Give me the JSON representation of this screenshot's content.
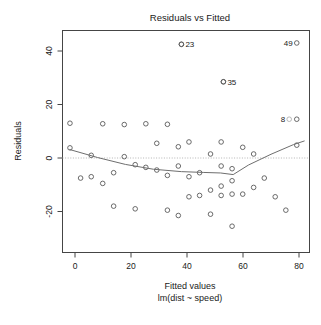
{
  "chart_data": {
    "type": "scatter",
    "title": "Residuals vs Fitted",
    "xlabel": "Fitted values",
    "sublabel": "lm(dist ~ speed)",
    "ylabel": "Residuals",
    "xlim": [
      -7,
      84
    ],
    "ylim": [
      -31,
      48
    ],
    "xticks": [
      0,
      20,
      40,
      60,
      80
    ],
    "xtick_labels": [
      "0",
      "20",
      "40",
      "60",
      "80"
    ],
    "yticks": [
      -20,
      0,
      20,
      40
    ],
    "ytick_labels": [
      "-20",
      "0",
      "20",
      "40"
    ],
    "grid": false,
    "zero_reference_line": 0,
    "legend": null,
    "point_color": "#5a5a5a",
    "smoother_color": "#6e6e6e",
    "zero_line_color": "#b4b4b4",
    "points": [
      {
        "x": -1.8,
        "y": 3.8
      },
      {
        "x": -1.8,
        "y": 13.0
      },
      {
        "x": 2.0,
        "y": -7.5
      },
      {
        "x": 5.8,
        "y": -7.0
      },
      {
        "x": 5.8,
        "y": 1.0
      },
      {
        "x": 9.9,
        "y": 12.8
      },
      {
        "x": 9.9,
        "y": -9.5
      },
      {
        "x": 13.8,
        "y": -5.5
      },
      {
        "x": 13.8,
        "y": -18.0
      },
      {
        "x": 17.6,
        "y": 0.5
      },
      {
        "x": 17.6,
        "y": 12.5
      },
      {
        "x": 21.5,
        "y": -2.5
      },
      {
        "x": 21.5,
        "y": -19.0
      },
      {
        "x": 25.3,
        "y": -3.5
      },
      {
        "x": 25.3,
        "y": 12.8
      },
      {
        "x": 29.2,
        "y": -4.5
      },
      {
        "x": 29.2,
        "y": 5.5
      },
      {
        "x": 33.0,
        "y": -6.5
      },
      {
        "x": 33.0,
        "y": 12.6
      },
      {
        "x": 33.0,
        "y": -19.5
      },
      {
        "x": 36.9,
        "y": -3.0
      },
      {
        "x": 36.9,
        "y": 4.2
      },
      {
        "x": 36.9,
        "y": -21.5
      },
      {
        "x": 38.0,
        "y": 42.5
      },
      {
        "x": 40.7,
        "y": -7.0
      },
      {
        "x": 40.7,
        "y": 6.0
      },
      {
        "x": 40.7,
        "y": -14.5
      },
      {
        "x": 44.5,
        "y": -5.5
      },
      {
        "x": 44.5,
        "y": -14.0
      },
      {
        "x": 48.4,
        "y": 1.5
      },
      {
        "x": 48.4,
        "y": -12.0
      },
      {
        "x": 48.4,
        "y": -21.0
      },
      {
        "x": 52.2,
        "y": 6.0
      },
      {
        "x": 52.2,
        "y": -3.0
      },
      {
        "x": 52.2,
        "y": -10.5
      },
      {
        "x": 52.2,
        "y": -14.0
      },
      {
        "x": 53.0,
        "y": 28.5
      },
      {
        "x": 56.1,
        "y": -4.0
      },
      {
        "x": 56.1,
        "y": -8.5
      },
      {
        "x": 56.1,
        "y": -13.5
      },
      {
        "x": 56.1,
        "y": -25.5
      },
      {
        "x": 59.9,
        "y": 4.0
      },
      {
        "x": 59.9,
        "y": -13.5
      },
      {
        "x": 63.8,
        "y": 1.5
      },
      {
        "x": 63.8,
        "y": -11.0
      },
      {
        "x": 67.6,
        "y": -7.5
      },
      {
        "x": 71.5,
        "y": -14.5
      },
      {
        "x": 75.3,
        "y": -19.5
      },
      {
        "x": 79.2,
        "y": 14.5
      },
      {
        "x": 79.2,
        "y": 4.8
      }
    ],
    "labeled_points": [
      {
        "label": "23",
        "x": 38.0,
        "y": 42.5,
        "label_side": "right"
      },
      {
        "label": "35",
        "x": 53.0,
        "y": 28.5,
        "label_side": "right"
      },
      {
        "label": "49",
        "x": 79.2,
        "y": 43.0,
        "label_side": "left"
      },
      {
        "label": "8",
        "x": 76.5,
        "y": 14.5,
        "label_side": "left"
      }
    ],
    "smoother": [
      {
        "x": -2.0,
        "y": 3.2
      },
      {
        "x": 8.0,
        "y": 0.2
      },
      {
        "x": 18.0,
        "y": -2.4
      },
      {
        "x": 28.0,
        "y": -4.2
      },
      {
        "x": 38.0,
        "y": -5.1
      },
      {
        "x": 46.0,
        "y": -5.4
      },
      {
        "x": 52.0,
        "y": -5.6
      },
      {
        "x": 56.5,
        "y": -6.2
      },
      {
        "x": 62.0,
        "y": -2.6
      },
      {
        "x": 70.0,
        "y": 1.4
      },
      {
        "x": 78.0,
        "y": 5.0
      },
      {
        "x": 82.0,
        "y": 6.4
      }
    ]
  }
}
